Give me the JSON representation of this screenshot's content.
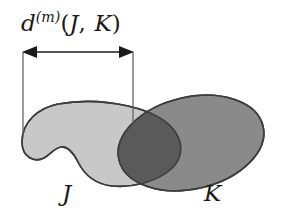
{
  "figure": {
    "background_color": "#ffffff",
    "width": 285,
    "height": 222
  },
  "annotation": {
    "distance_label": {
      "full_text": "d(m)(J, K)",
      "base_symbol": "d",
      "superscript": "(m)",
      "open_paren": "(",
      "arg_first": "J",
      "comma": ",",
      "arg_second": "K",
      "close_paren": ")"
    },
    "measure_arrow": {
      "name": "double-headed-arrow",
      "x_start": 23,
      "x_end": 133,
      "y": 52,
      "color": "#1a1a1a"
    },
    "leader_lines": [
      {
        "x": 23,
        "y_top": 52,
        "y_bottom": 136,
        "color": "#5a5a5a"
      },
      {
        "x": 133,
        "y_top": 52,
        "y_bottom": 152,
        "color": "#5a5a5a"
      }
    ]
  },
  "shapes": {
    "set_j": {
      "label": "J",
      "fill_color": "#c8c8c8",
      "stroke_color": "#3d3d3d",
      "description": "light gray kidney shaped blob with concave notch on lower left"
    },
    "set_k": {
      "label": "K",
      "fill_color": "#8a8a8a",
      "stroke_color": "#3d3d3d",
      "description": "medium gray tilted ellipse"
    },
    "intersection": {
      "fill_color": "#5a5a5a",
      "description": "dark gray lens shaped overlap of J and K"
    }
  }
}
